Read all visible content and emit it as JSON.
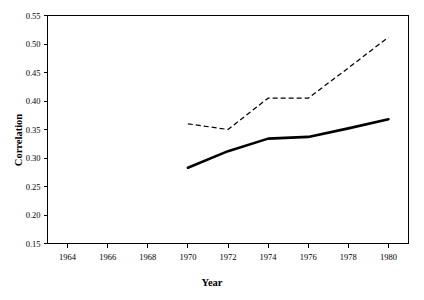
{
  "chart_data": {
    "type": "line",
    "title": "",
    "xlabel": "Year",
    "ylabel": "Correlation",
    "xlim": [
      1963,
      1981
    ],
    "ylim": [
      0.15,
      0.55
    ],
    "grid": false,
    "legend": "none",
    "x_ticks": [
      1964,
      1966,
      1968,
      1970,
      1972,
      1974,
      1976,
      1978,
      1980
    ],
    "x_tick_labels": [
      "1964",
      "1966",
      "1968",
      "1970",
      "1972",
      "1974",
      "1976",
      "1978",
      "1980"
    ],
    "y_ticks": [
      0.15,
      0.2,
      0.25,
      0.3,
      0.35,
      0.4,
      0.45,
      0.5,
      0.55
    ],
    "y_tick_labels": [
      "0.15",
      "0.20",
      "0.25",
      "0.30",
      "0.35",
      "0.40",
      "0.45",
      "0.50",
      "0.55"
    ],
    "series": [
      {
        "name": "dashed-series",
        "style": "dashed",
        "color": "#000000",
        "x": [
          1970,
          1972,
          1974,
          1976,
          1978,
          1980
        ],
        "values": [
          0.36,
          0.35,
          0.405,
          0.405,
          0.458,
          0.512
        ]
      },
      {
        "name": "solid-series",
        "style": "solid",
        "color": "#000000",
        "x": [
          1970,
          1972,
          1974,
          1976,
          1978,
          1980
        ],
        "values": [
          0.283,
          0.312,
          0.334,
          0.337,
          0.352,
          0.368
        ]
      }
    ]
  }
}
